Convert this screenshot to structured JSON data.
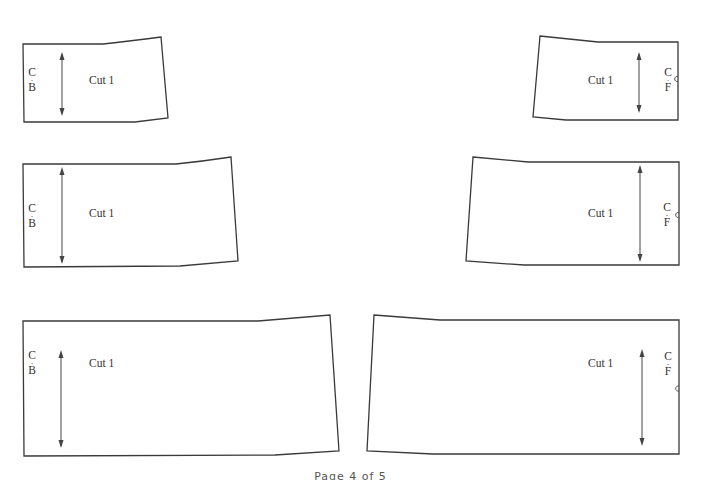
{
  "document": {
    "type": "sewing-pattern-sheet",
    "footer": "Page 4 of 5"
  },
  "pieces": [
    {
      "id": "back-top",
      "side": "left",
      "cut_label": "Cut 1",
      "fold_label": {
        "top": "C",
        "bottom": "B"
      },
      "fold_meaning": "Center Back"
    },
    {
      "id": "front-top",
      "side": "right",
      "cut_label": "Cut 1",
      "fold_label": {
        "top": "C",
        "bottom": "F"
      },
      "fold_meaning": "Center Front"
    },
    {
      "id": "back-middle",
      "side": "left",
      "cut_label": "Cut 1",
      "fold_label": {
        "top": "C",
        "bottom": "B"
      },
      "fold_meaning": "Center Back"
    },
    {
      "id": "front-middle",
      "side": "right",
      "cut_label": "Cut 1",
      "fold_label": {
        "top": "C",
        "bottom": "F"
      },
      "fold_meaning": "Center Front"
    },
    {
      "id": "back-bottom",
      "side": "left",
      "cut_label": "Cut 1",
      "fold_label": {
        "top": "C",
        "bottom": "B"
      },
      "fold_meaning": "Center Back"
    },
    {
      "id": "front-bottom",
      "side": "right",
      "cut_label": "Cut 1",
      "fold_label": {
        "top": "C",
        "bottom": "F"
      },
      "fold_meaning": "Center Front"
    }
  ],
  "colors": {
    "outline": "#3a3a3a",
    "text": "#333333",
    "background": "#ffffff"
  }
}
